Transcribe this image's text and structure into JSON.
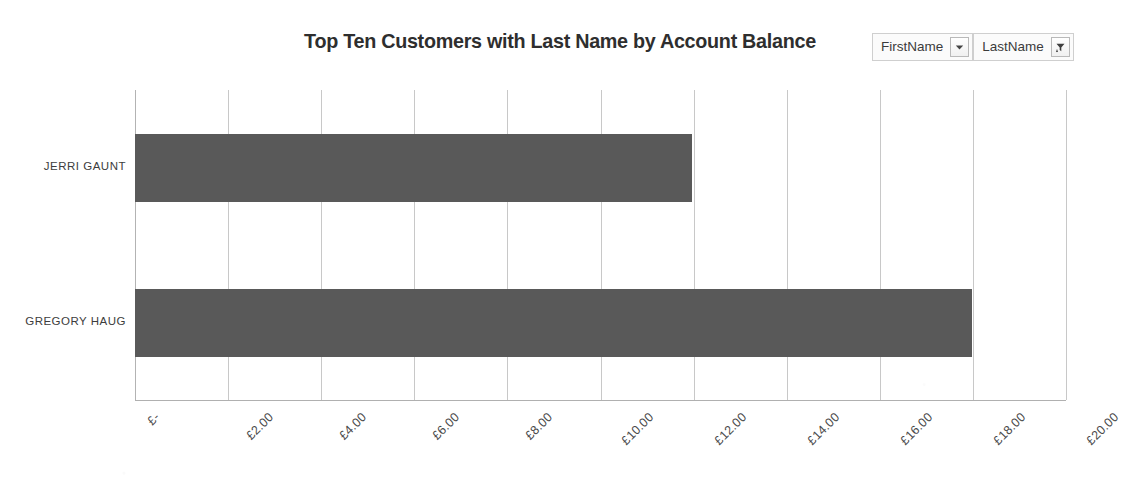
{
  "chart_data": {
    "type": "bar",
    "orientation": "horizontal",
    "title": "Top Ten Customers with Last Name by Account Balance",
    "categories": [
      "JERRI GAUNT",
      "GREGORY HAUG"
    ],
    "values": [
      11.97,
      17.97
    ],
    "series": [
      {
        "name": "Account Balance",
        "values": [
          11.97,
          17.97
        ]
      }
    ],
    "xlabel": "",
    "ylabel": "",
    "xlim": [
      0,
      20
    ],
    "xticks": [
      0,
      2,
      4,
      6,
      8,
      10,
      12,
      14,
      16,
      18,
      20
    ],
    "xtick_labels": [
      "£-",
      "£2.00",
      "£4.00",
      "£6.00",
      "£8.00",
      "£10.00",
      "£12.00",
      "£14.00",
      "£16.00",
      "£18.00",
      "£20.00"
    ],
    "grid": true,
    "grid_axis": "x",
    "legend": false,
    "bar_color": "#595959",
    "gridline_color": "#b6b6b6",
    "background_color": "#ffffff",
    "tick_label_rotation": -45
  },
  "slicers": {
    "first_name": {
      "label": "FirstName",
      "dropdown_icon": "chevron-down-icon"
    },
    "last_name": {
      "label": "LastName",
      "filter_icon": "funnel-filter-icon"
    }
  }
}
